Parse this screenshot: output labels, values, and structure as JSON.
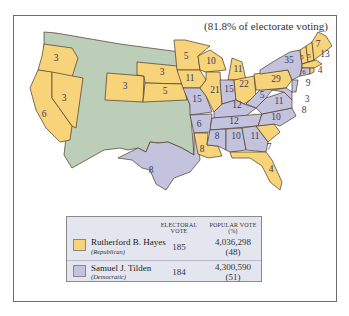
{
  "map": {
    "subtitle": "(81.8% of electorate voting)",
    "colors": {
      "republican": "#f7d37a",
      "democratic": "#c4c3dd",
      "territory": "#bccdb8",
      "border": "#4a3a2a",
      "legend_bg": "#e3e6ef"
    },
    "state_labels": [
      {
        "state": "Oregon",
        "votes": "3",
        "party": "republican"
      },
      {
        "state": "Nevada",
        "votes": "3",
        "party": "republican"
      },
      {
        "state": "California",
        "votes": "6",
        "party": "republican"
      },
      {
        "state": "Colorado",
        "votes": "3",
        "party": "republican"
      },
      {
        "state": "Nebraska",
        "votes": "3",
        "party": "republican"
      },
      {
        "state": "Kansas",
        "votes": "5",
        "party": "republican"
      },
      {
        "state": "Texas",
        "votes": "8",
        "party": "democratic"
      },
      {
        "state": "Minnesota",
        "votes": "5",
        "party": "republican"
      },
      {
        "state": "Iowa",
        "votes": "11",
        "party": "republican"
      },
      {
        "state": "Missouri",
        "votes": "15",
        "party": "democratic"
      },
      {
        "state": "Arkansas",
        "votes": "6",
        "party": "democratic"
      },
      {
        "state": "Louisiana",
        "votes": "8",
        "party": "republican"
      },
      {
        "state": "Wisconsin",
        "votes": "10",
        "party": "republican"
      },
      {
        "state": "Illinois",
        "votes": "21",
        "party": "republican"
      },
      {
        "state": "Michigan",
        "votes": "11",
        "party": "republican"
      },
      {
        "state": "Indiana",
        "votes": "15",
        "party": "democratic"
      },
      {
        "state": "Ohio",
        "votes": "22",
        "party": "republican"
      },
      {
        "state": "Kentucky",
        "votes": "12",
        "party": "democratic"
      },
      {
        "state": "Tennessee",
        "votes": "12",
        "party": "democratic"
      },
      {
        "state": "Mississippi",
        "votes": "8",
        "party": "democratic"
      },
      {
        "state": "Alabama",
        "votes": "10",
        "party": "democratic"
      },
      {
        "state": "Georgia",
        "votes": "11",
        "party": "democratic"
      },
      {
        "state": "South Carolina",
        "votes": "7",
        "party": "republican"
      },
      {
        "state": "Florida",
        "votes": "4",
        "party": "republican"
      },
      {
        "state": "North Carolina",
        "votes": "10",
        "party": "democratic"
      },
      {
        "state": "Virginia",
        "votes": "11",
        "party": "democratic"
      },
      {
        "state": "West Virginia",
        "votes": "5",
        "party": "democratic"
      },
      {
        "state": "Pennsylvania",
        "votes": "29",
        "party": "republican"
      },
      {
        "state": "New York",
        "votes": "35",
        "party": "democratic"
      },
      {
        "state": "Maine",
        "votes": "7",
        "party": "republican"
      },
      {
        "state": "Vermont",
        "votes": "5",
        "party": "republican"
      },
      {
        "state": "New Hampshire",
        "votes": "5",
        "party": "republican"
      },
      {
        "state": "Massachusetts",
        "votes": "13",
        "party": "republican"
      },
      {
        "state": "Rhode Island",
        "votes": "4",
        "party": "republican"
      },
      {
        "state": "Connecticut",
        "votes": "6",
        "party": "democratic"
      },
      {
        "state": "New Jersey",
        "votes": "9",
        "party": "democratic"
      },
      {
        "state": "Delaware",
        "votes": "3",
        "party": "democratic"
      },
      {
        "state": "Maryland",
        "votes": "8",
        "party": "democratic"
      }
    ]
  },
  "legend": {
    "headers": {
      "electoral_line1": "ELECTORAL",
      "electoral_line2": "VOTE",
      "popular_line1": "POPULAR VOTE",
      "popular_line2": "(%)"
    },
    "rows": [
      {
        "candidate": "Rutherford B. Hayes",
        "party": "(Republican)",
        "electoral": "185",
        "popular": "4,036,298",
        "percent": "(48)",
        "color": "#f7d37a"
      },
      {
        "candidate": "Samuel J. Tilden",
        "party": "(Democratic)",
        "electoral": "184",
        "popular": "4,300,590",
        "percent": "(51)",
        "color": "#c4c3dd"
      }
    ]
  }
}
